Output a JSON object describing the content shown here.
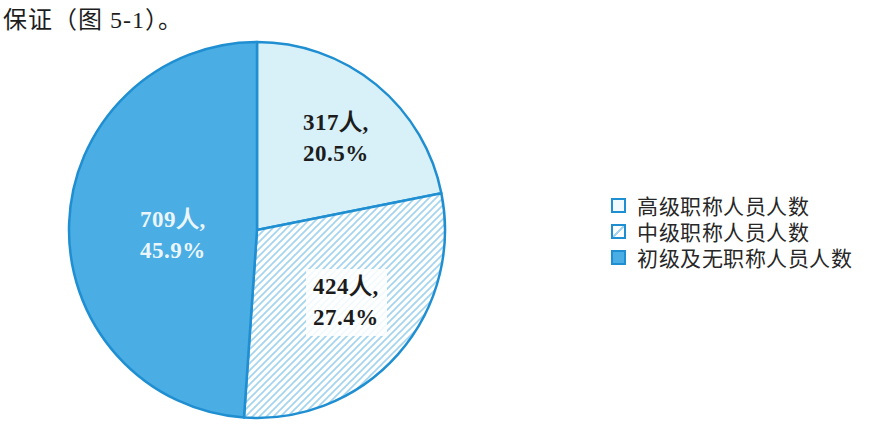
{
  "page": {
    "intro_text": "保证（图 5-1）。"
  },
  "chart_data": {
    "type": "pie",
    "title": "",
    "direction": "clockwise",
    "start_angle_deg": 0,
    "legend_position": "right",
    "slices": [
      {
        "name": "高级职称人员人数",
        "count": 317,
        "percent": 20.5,
        "label_line1": "317人,",
        "label_line2": "20.5%",
        "style": "light"
      },
      {
        "name": "中级职称人员人数",
        "count": 424,
        "percent": 27.4,
        "label_line1": "424人,",
        "label_line2": "27.4%",
        "style": "hatch"
      },
      {
        "name": "初级及无职称人员人数",
        "count": 709,
        "percent": 45.9,
        "label_line1": "709人,",
        "label_line2": "45.9%",
        "style": "solid"
      }
    ],
    "colors": {
      "solid_fill": "#4aade3",
      "light_fill": "#d8f0f8",
      "hatch_bg": "#ffffff",
      "hatch_line": "#a3d4ef",
      "outline": "#1f8fd2",
      "label_dark": "#1c1c1c",
      "label_light": "#eaf6fc",
      "legend_light_fill": "#f2fafd",
      "legend_text": "#272727",
      "hatch_label_bg": "rgba(255,255,255,0.85)"
    }
  }
}
